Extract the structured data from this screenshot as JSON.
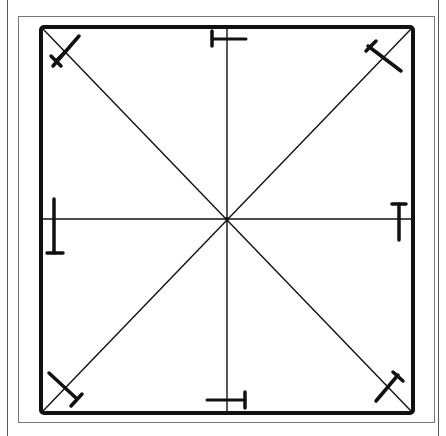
{
  "diagram": {
    "title": "",
    "width": 446,
    "height": 436,
    "colors": {
      "background": "#ffffff",
      "ink": "#111111",
      "frame": "#777777",
      "page_edge": "#555555"
    },
    "page_edges": [
      {
        "x": 7
      },
      {
        "x": 438
      }
    ],
    "outer_frame": {
      "x": 18,
      "y": 16,
      "w": 417,
      "h": 407
    },
    "square": {
      "x": 41,
      "y": 27,
      "w": 372,
      "h": 386,
      "stroke_width": 4
    },
    "center": {
      "x": 227,
      "y": 219
    },
    "spokes": [
      "top",
      "bottom",
      "left",
      "right",
      "top-left",
      "top-right",
      "bottom-left",
      "bottom-right"
    ],
    "markers": [
      {
        "position": "top-left",
        "shape": "T"
      },
      {
        "position": "top",
        "shape": "T"
      },
      {
        "position": "top-right",
        "shape": "T"
      },
      {
        "position": "left",
        "shape": "T"
      },
      {
        "position": "right",
        "shape": "T"
      },
      {
        "position": "bottom-left",
        "shape": "T"
      },
      {
        "position": "bottom",
        "shape": "T"
      },
      {
        "position": "bottom-right",
        "shape": "T"
      }
    ]
  }
}
